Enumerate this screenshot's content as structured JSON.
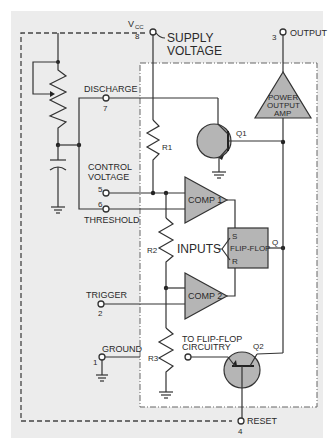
{
  "diagram": {
    "colors": {
      "panel_bg": "#ececec",
      "inner_bg": "#ffffff",
      "component_fill": "#b5b5b5",
      "wire": "#333333"
    },
    "pins": {
      "vcc": {
        "symbol": "V",
        "subscript": "CC",
        "number": "8",
        "label_line1": "SUPPLY",
        "label_line2": "VOLTAGE"
      },
      "output": {
        "number": "3",
        "label": "OUTPUT"
      },
      "discharge": {
        "number": "7",
        "label": "DISCHARGE"
      },
      "control": {
        "number": "5",
        "label_line1": "CONTROL",
        "label_line2": "VOLTAGE"
      },
      "threshold": {
        "number": "6",
        "label": "THRESHOLD"
      },
      "trigger": {
        "number": "2",
        "label": "TRIGGER"
      },
      "ground": {
        "number": "1",
        "label": "GROUND"
      },
      "reset": {
        "number": "4",
        "label": "RESET"
      }
    },
    "components": {
      "r1": "R1",
      "r2": "R2",
      "r3": "R3",
      "comp1": "COMP 1",
      "comp2": "COMP 2",
      "flipflop": "FLIP-FLOP",
      "ff_s": "S",
      "ff_r": "R",
      "ff_q": "Q",
      "inputs": "INPUTS",
      "q1": "Q1",
      "q2": "Q2",
      "amp_line1": "POWER",
      "amp_line2": "OUTPUT",
      "amp_line3": "AMP",
      "to_ff_line1": "TO FLIP-FLOP",
      "to_ff_line2": "CIRCUITRY"
    }
  }
}
